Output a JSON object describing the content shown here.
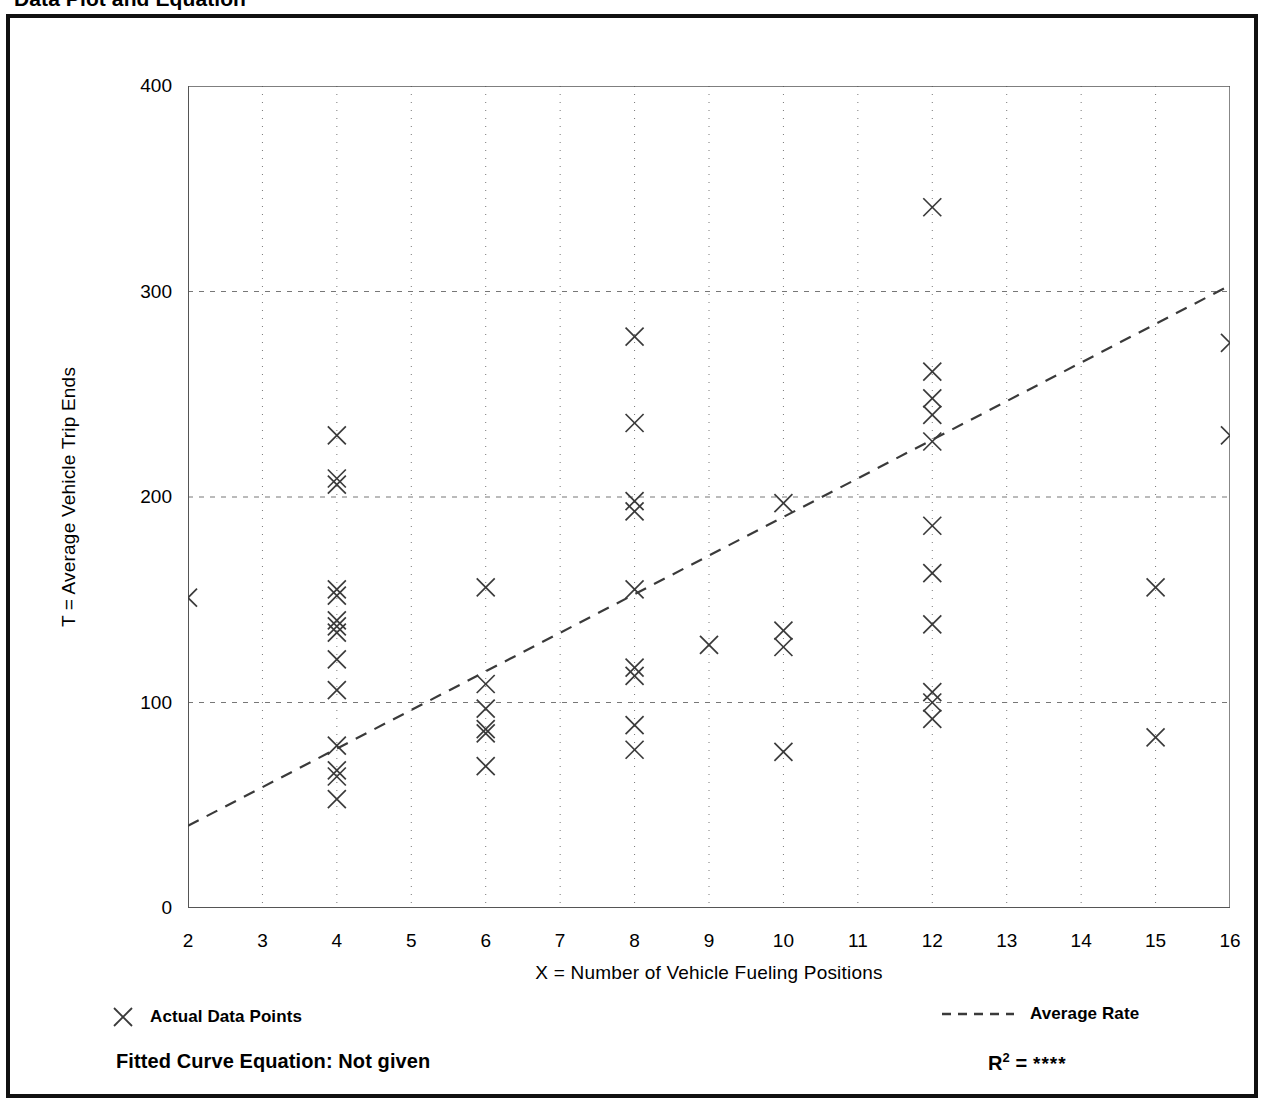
{
  "page_title": "Data Plot and Equation",
  "axes": {
    "x_title": "X = Number of Vehicle Fueling Positions",
    "y_title": "T = Average Vehicle Trip Ends"
  },
  "legend": {
    "points_label": "Actual Data Points",
    "points_marker": "x-marker-icon",
    "line_label": "Average Rate",
    "line_marker": "dashed-line-icon"
  },
  "footer": {
    "equation_label": "Fitted Curve Equation:  Not given",
    "r2_label": "R",
    "r2_exponent": "2",
    "r2_equals": " = ",
    "r2_value": "****"
  },
  "colors": {
    "frame": "#111111",
    "axis": "#555555",
    "grid": "#777777",
    "marker": "#3a3a3a",
    "trend": "#3a3a3a",
    "text": "#000000"
  },
  "chart_data": {
    "type": "scatter",
    "title": "Data Plot and Equation",
    "xlabel": "X = Number of Vehicle Fueling Positions",
    "ylabel": "T = Average Vehicle Trip Ends",
    "xlim": [
      2,
      16
    ],
    "ylim": [
      0,
      400
    ],
    "xticks": [
      2,
      3,
      4,
      5,
      6,
      7,
      8,
      9,
      10,
      11,
      12,
      13,
      14,
      15,
      16
    ],
    "yticks": [
      0,
      100,
      200,
      300,
      400
    ],
    "y_minor_ticks": [
      50,
      150,
      250,
      350
    ],
    "grid": "dotted-vertical-at-x-ticks, dashed-horizontal-at-y-major",
    "legend_position": "below-axes",
    "series": [
      {
        "name": "Actual Data Points",
        "marker": "x",
        "points": [
          [
            2,
            151
          ],
          [
            4,
            230
          ],
          [
            4,
            209
          ],
          [
            4,
            206
          ],
          [
            4,
            155
          ],
          [
            4,
            152
          ],
          [
            4,
            140
          ],
          [
            4,
            137
          ],
          [
            4,
            134
          ],
          [
            4,
            121
          ],
          [
            4,
            106
          ],
          [
            4,
            79
          ],
          [
            4,
            67
          ],
          [
            4,
            64
          ],
          [
            4,
            53
          ],
          [
            6,
            156
          ],
          [
            6,
            109
          ],
          [
            6,
            97
          ],
          [
            6,
            87
          ],
          [
            6,
            85
          ],
          [
            6,
            69
          ],
          [
            8,
            278
          ],
          [
            8,
            236
          ],
          [
            8,
            198
          ],
          [
            8,
            193
          ],
          [
            8,
            155
          ],
          [
            8,
            117
          ],
          [
            8,
            113
          ],
          [
            8,
            89
          ],
          [
            8,
            77
          ],
          [
            9,
            128
          ],
          [
            10,
            197
          ],
          [
            10,
            135
          ],
          [
            10,
            127
          ],
          [
            10,
            76
          ],
          [
            12,
            341
          ],
          [
            12,
            261
          ],
          [
            12,
            248
          ],
          [
            12,
            240
          ],
          [
            12,
            227
          ],
          [
            12,
            186
          ],
          [
            12,
            163
          ],
          [
            12,
            138
          ],
          [
            12,
            105
          ],
          [
            12,
            100
          ],
          [
            12,
            92
          ],
          [
            15,
            156
          ],
          [
            15,
            83
          ],
          [
            16,
            275
          ],
          [
            16,
            230
          ]
        ]
      }
    ],
    "trendline": {
      "name": "Average Rate",
      "style": "dashed",
      "x": [
        2,
        16
      ],
      "y": [
        40,
        303
      ]
    }
  }
}
